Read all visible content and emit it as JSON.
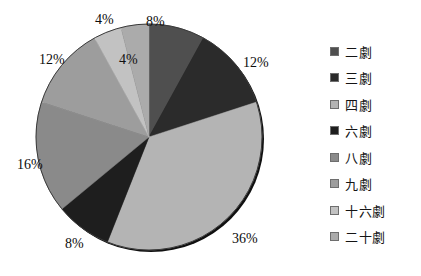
{
  "chart_data": {
    "type": "pie",
    "title": "",
    "labels": [
      "二劇",
      "三劇",
      "四劇",
      "六劇",
      "八劇",
      "九劇",
      "十六劇",
      "二十劇"
    ],
    "values": [
      8,
      12,
      36,
      8,
      16,
      12,
      4,
      4
    ],
    "value_labels": [
      "8%",
      "12%",
      "36%",
      "8%",
      "16%",
      "12%",
      "4%",
      "4%"
    ],
    "units": "%",
    "total": 100,
    "start_angle_deg": 0,
    "direction": "clockwise",
    "legend_position": "right",
    "grid": false,
    "colors": [
      "#4f4f4f",
      "#2b2b2b",
      "#b4b4b4",
      "#1e1e1e",
      "#8a8a8a",
      "#9d9d9d",
      "#c2c2c2",
      "#ababab"
    ],
    "slices": [
      {
        "label": "二劇",
        "value": 8,
        "value_label": "8%",
        "color": "#4f4f4f"
      },
      {
        "label": "三劇",
        "value": 12,
        "value_label": "12%",
        "color": "#2b2b2b"
      },
      {
        "label": "四劇",
        "value": 36,
        "value_label": "36%",
        "color": "#b4b4b4"
      },
      {
        "label": "六劇",
        "value": 8,
        "value_label": "8%",
        "color": "#1e1e1e"
      },
      {
        "label": "八劇",
        "value": 16,
        "value_label": "16%",
        "color": "#8a8a8a"
      },
      {
        "label": "九劇",
        "value": 12,
        "value_label": "12%",
        "color": "#9d9d9d"
      },
      {
        "label": "十六劇",
        "value": 4,
        "value_label": "4%",
        "color": "#c2c2c2"
      },
      {
        "label": "二十劇",
        "value": 4,
        "value_label": "4%",
        "color": "#ababab"
      }
    ]
  },
  "legend": {
    "items": [
      {
        "label": "二劇",
        "color": "#4f4f4f"
      },
      {
        "label": "三劇",
        "color": "#2b2b2b"
      },
      {
        "label": "四劇",
        "color": "#b4b4b4"
      },
      {
        "label": "六劇",
        "color": "#1e1e1e"
      },
      {
        "label": "八劇",
        "color": "#8a8a8a"
      },
      {
        "label": "九劇",
        "color": "#9d9d9d"
      },
      {
        "label": "十六劇",
        "color": "#c2c2c2"
      },
      {
        "label": "二十劇",
        "color": "#ababab"
      }
    ]
  },
  "callouts": {
    "top_small": "4%",
    "top_right": "8%",
    "right": "12%",
    "bottom_right": "36%",
    "bottom_left": "8%",
    "left": "16%",
    "upper_left": "12%",
    "inner_top": "4%"
  }
}
